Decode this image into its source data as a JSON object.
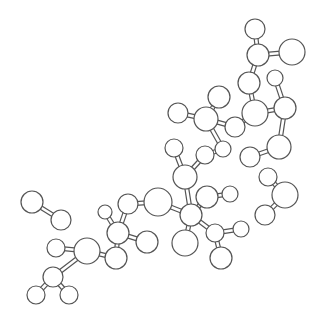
{
  "diagram": {
    "type": "ball-and-stick-molecule",
    "background": "#ffffff",
    "stroke_color": "#555555",
    "atoms": [
      {
        "id": "a1",
        "x": 255,
        "y": 29,
        "r": 10
      },
      {
        "id": "a2",
        "x": 258,
        "y": 55,
        "r": 11
      },
      {
        "id": "a3",
        "x": 292,
        "y": 52,
        "r": 13
      },
      {
        "id": "a4",
        "x": 249,
        "y": 83,
        "r": 11
      },
      {
        "id": "a5",
        "x": 275,
        "y": 78,
        "r": 8
      },
      {
        "id": "a6",
        "x": 219,
        "y": 97,
        "r": 11
      },
      {
        "id": "a7",
        "x": 178,
        "y": 113,
        "r": 10
      },
      {
        "id": "a8",
        "x": 206,
        "y": 119,
        "r": 12
      },
      {
        "id": "a9",
        "x": 255,
        "y": 113,
        "r": 13
      },
      {
        "id": "a10",
        "x": 285,
        "y": 108,
        "r": 11
      },
      {
        "id": "a11",
        "x": 235,
        "y": 127,
        "r": 10
      },
      {
        "id": "a12",
        "x": 223,
        "y": 149,
        "r": 8
      },
      {
        "id": "a13",
        "x": 279,
        "y": 147,
        "r": 12
      },
      {
        "id": "a14",
        "x": 174,
        "y": 148,
        "r": 9
      },
      {
        "id": "a15",
        "x": 205,
        "y": 155,
        "r": 9
      },
      {
        "id": "a16",
        "x": 250,
        "y": 157,
        "r": 10
      },
      {
        "id": "a17",
        "x": 185,
        "y": 177,
        "r": 12
      },
      {
        "id": "a18",
        "x": 207,
        "y": 197,
        "r": 11
      },
      {
        "id": "a19",
        "x": 230,
        "y": 194,
        "r": 8
      },
      {
        "id": "a20",
        "x": 191,
        "y": 215,
        "r": 11
      },
      {
        "id": "a21",
        "x": 158,
        "y": 202,
        "r": 14
      },
      {
        "id": "a22",
        "x": 215,
        "y": 233,
        "r": 9
      },
      {
        "id": "a23",
        "x": 241,
        "y": 229,
        "r": 8
      },
      {
        "id": "a24",
        "x": 185,
        "y": 243,
        "r": 13
      },
      {
        "id": "a25",
        "x": 221,
        "y": 258,
        "r": 11
      },
      {
        "id": "a26",
        "x": 268,
        "y": 177,
        "r": 9
      },
      {
        "id": "a27",
        "x": 285,
        "y": 195,
        "r": 13
      },
      {
        "id": "a28",
        "x": 265,
        "y": 215,
        "r": 10
      },
      {
        "id": "a29",
        "x": 32,
        "y": 202,
        "r": 11
      },
      {
        "id": "a30",
        "x": 61,
        "y": 220,
        "r": 10
      },
      {
        "id": "a31",
        "x": 128,
        "y": 204,
        "r": 10
      },
      {
        "id": "a32",
        "x": 105,
        "y": 212,
        "r": 7
      },
      {
        "id": "a33",
        "x": 118,
        "y": 233,
        "r": 11
      },
      {
        "id": "a34",
        "x": 147,
        "y": 242,
        "r": 11
      },
      {
        "id": "a35",
        "x": 56,
        "y": 248,
        "r": 9
      },
      {
        "id": "a36",
        "x": 87,
        "y": 251,
        "r": 13
      },
      {
        "id": "a37",
        "x": 116,
        "y": 258,
        "r": 11
      },
      {
        "id": "a38",
        "x": 53,
        "y": 277,
        "r": 10
      },
      {
        "id": "a39",
        "x": 36,
        "y": 295,
        "r": 9
      },
      {
        "id": "a40",
        "x": 69,
        "y": 295,
        "r": 9
      }
    ],
    "bonds": [
      [
        "a1",
        "a2"
      ],
      [
        "a2",
        "a3"
      ],
      [
        "a2",
        "a4"
      ],
      [
        "a4",
        "a9"
      ],
      [
        "a5",
        "a10"
      ],
      [
        "a9",
        "a10"
      ],
      [
        "a9",
        "a11"
      ],
      [
        "a10",
        "a13"
      ],
      [
        "a11",
        "a8"
      ],
      [
        "a8",
        "a6"
      ],
      [
        "a8",
        "a7"
      ],
      [
        "a8",
        "a12"
      ],
      [
        "a12",
        "a15"
      ],
      [
        "a15",
        "a17"
      ],
      [
        "a14",
        "a17"
      ],
      [
        "a13",
        "a16"
      ],
      [
        "a17",
        "a20"
      ],
      [
        "a18",
        "a20"
      ],
      [
        "a18",
        "a19"
      ],
      [
        "a20",
        "a21"
      ],
      [
        "a20",
        "a22"
      ],
      [
        "a20",
        "a24"
      ],
      [
        "a22",
        "a23"
      ],
      [
        "a22",
        "a25"
      ],
      [
        "a26",
        "a27"
      ],
      [
        "a27",
        "a28"
      ],
      [
        "a29",
        "a30"
      ],
      [
        "a21",
        "a31"
      ],
      [
        "a31",
        "a33"
      ],
      [
        "a32",
        "a33"
      ],
      [
        "a33",
        "a34"
      ],
      [
        "a33",
        "a37"
      ],
      [
        "a35",
        "a36"
      ],
      [
        "a36",
        "a37"
      ],
      [
        "a36",
        "a38"
      ],
      [
        "a38",
        "a39"
      ],
      [
        "a38",
        "a40"
      ]
    ]
  }
}
